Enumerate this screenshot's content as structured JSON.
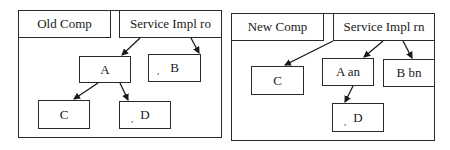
{
  "left_diagram": {
    "component_label": "Old Comp",
    "service_label": "Service Impl ro",
    "nodes": {
      "a": "A",
      "b": "B",
      "c": "C",
      "d": "D"
    },
    "mark": ","
  },
  "right_diagram": {
    "component_label": "New Comp",
    "service_label": "Service Impl rn",
    "nodes": {
      "c": "C",
      "a": "A an",
      "b": "B bn",
      "d": "D"
    },
    "mark": ","
  },
  "colors": {
    "line": "#2a2a2a",
    "background": "#ffffff"
  }
}
